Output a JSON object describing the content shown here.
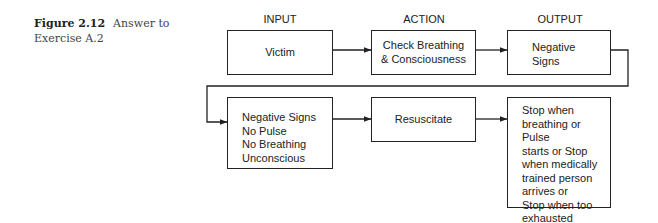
{
  "caption": {
    "figure_label": "Figure 2.12",
    "text": "Answer to Exercise A.2"
  },
  "columns": [
    "INPUT",
    "ACTION",
    "OUTPUT"
  ],
  "row1": {
    "input": "Victim",
    "action_lines": [
      "Check Breathing",
      "& Consciousness"
    ],
    "output_lines": [
      "Negative",
      "Signs"
    ]
  },
  "row2": {
    "input_lines": [
      "Negative Signs",
      "No Pulse",
      "No Breathing",
      "Unconscious"
    ],
    "action": "Resuscitate",
    "output_lines": [
      "Stop when",
      "breathing or Pulse",
      "starts or Stop",
      "when medically",
      "trained person",
      "arrives or",
      "Stop when too",
      "exhausted"
    ]
  }
}
